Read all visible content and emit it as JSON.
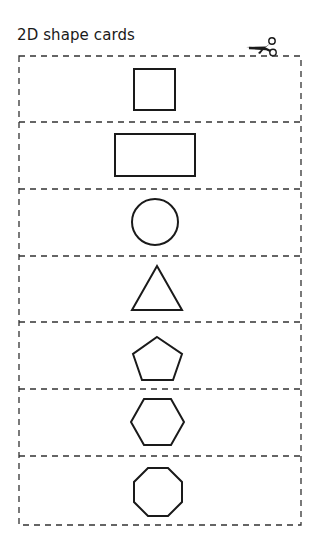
{
  "title": "2D shape cards",
  "icons": {
    "cut_marker": "scissors-icon"
  },
  "colors": {
    "line": "#1a1a1a",
    "dash": "#333333",
    "background": "#ffffff"
  },
  "cards": [
    {
      "shape": "square"
    },
    {
      "shape": "rectangle"
    },
    {
      "shape": "circle"
    },
    {
      "shape": "triangle"
    },
    {
      "shape": "pentagon"
    },
    {
      "shape": "hexagon"
    },
    {
      "shape": "octagon"
    }
  ]
}
